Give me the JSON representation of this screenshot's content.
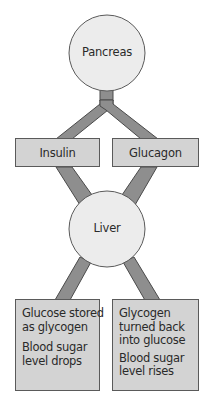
{
  "diagram": {
    "colors": {
      "circle_fill": "#ececec",
      "circle_stroke": "#5a5a5a",
      "box_fill": "#d3d3d3",
      "box_stroke": "#5a5a5a",
      "connector_fill": "#8e8e8e",
      "connector_stroke": "#4a4a4a",
      "text": "#2a2a2a"
    },
    "nodes": {
      "pancreas": {
        "label": "Pancreas"
      },
      "insulin": {
        "label": "Insulin"
      },
      "glucagon": {
        "label": "Glucagon"
      },
      "liver": {
        "label": "Liver"
      },
      "insulin_outcome": {
        "effect": [
          "Glucose stored",
          "as glycogen"
        ],
        "result": [
          "Blood sugar",
          "level drops"
        ]
      },
      "glucagon_outcome": {
        "effect": [
          "Glycogen",
          "turned back",
          "into glucose"
        ],
        "result": [
          "Blood sugar",
          "level rises"
        ]
      }
    },
    "edges": [
      {
        "from": "Pancreas",
        "to": "Insulin"
      },
      {
        "from": "Pancreas",
        "to": "Glucagon"
      },
      {
        "from": "Insulin",
        "to": "Liver"
      },
      {
        "from": "Glucagon",
        "to": "Liver"
      },
      {
        "from": "Liver",
        "to": "Glucose stored as glycogen"
      },
      {
        "from": "Liver",
        "to": "Glycogen turned back into glucose"
      }
    ]
  }
}
